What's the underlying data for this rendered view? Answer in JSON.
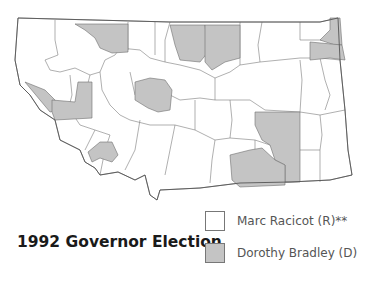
{
  "title": "1992 Governor Election",
  "legend": [
    {
      "label": "Marc Racicot (R)**",
      "color": "#ffffff"
    },
    {
      "label": "Dorothy Bradley (D)",
      "color": "#c4c4c4"
    }
  ],
  "colors": {
    "republican": "#ffffff",
    "democrat": "#c4c4c4",
    "border": "#6e6e6e"
  }
}
